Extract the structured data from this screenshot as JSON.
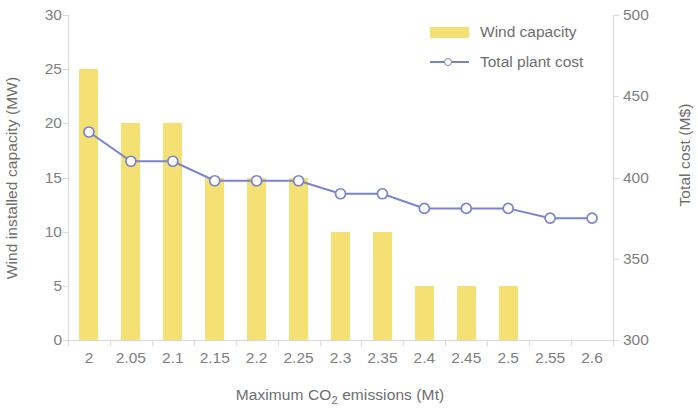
{
  "chart_data": {
    "type": "bar",
    "title": "",
    "xlabel": "Maximum CO2 emissions (Mt)",
    "xlabel_prefix": "Maximum CO",
    "xlabel_sub": "2",
    "xlabel_suffix": " emissions (Mt)",
    "ylabel": "Wind installed capacity (MW)",
    "ylabel_right": "Total cost (M$)",
    "categories": [
      "2",
      "2.05",
      "2.1",
      "2.15",
      "2.2",
      "2.25",
      "2.3",
      "2.35",
      "2.4",
      "2.45",
      "2.5",
      "2.55",
      "2.6"
    ],
    "ylim": [
      0,
      30
    ],
    "yticks": [
      "30",
      "25",
      "20",
      "15",
      "10",
      "5",
      "0"
    ],
    "ytick_values": [
      30,
      25,
      20,
      15,
      10,
      5,
      0
    ],
    "ylim_right": [
      300,
      500
    ],
    "yticks_right": [
      "500",
      "450",
      "400",
      "350",
      "300"
    ],
    "ytick_values_right": [
      500,
      450,
      400,
      350,
      300
    ],
    "grid": false,
    "legend_position": "top-right",
    "series": [
      {
        "name": "Wind capacity",
        "type": "bar",
        "axis": "left",
        "color": "#f4e073",
        "values": [
          25,
          20,
          20,
          15,
          15,
          15,
          10,
          10,
          5,
          5,
          5,
          0,
          0
        ]
      },
      {
        "name": "Total plant cost",
        "type": "line",
        "axis": "right",
        "color": "#7b83cf",
        "marker": "circle-open",
        "values": [
          428,
          410,
          410,
          398,
          398,
          398,
          390,
          390,
          381,
          381,
          381,
          375,
          375
        ]
      }
    ]
  },
  "legend": {
    "items": [
      {
        "label": "Wind capacity",
        "marker": "bar-swatch",
        "color": "#f4e073"
      },
      {
        "label": "Total plant cost",
        "marker": "line-circle",
        "color": "#7b83cf"
      }
    ]
  },
  "colors": {
    "bar": "#f4e073",
    "line": "#7b83cf",
    "axis": "#d9d9d9",
    "text": "#7a7a7a"
  }
}
